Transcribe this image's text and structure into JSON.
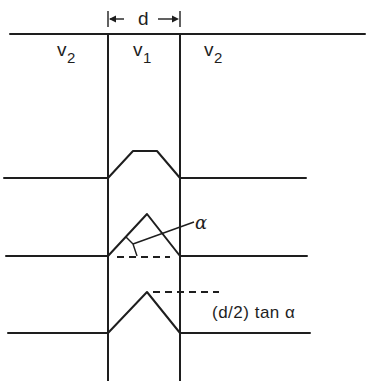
{
  "figure": {
    "type": "schematic",
    "width_label": "d",
    "regions": [
      {
        "label_base": "v",
        "label_sub": "2",
        "position": "left"
      },
      {
        "label_base": "v",
        "label_sub": "1",
        "position": "center"
      },
      {
        "label_base": "v",
        "label_sub": "2",
        "position": "right"
      }
    ],
    "profiles": [
      {
        "shape": "trapezoid",
        "annotation": ""
      },
      {
        "shape": "triangle",
        "annotation": "α"
      },
      {
        "shape": "triangle",
        "annotation": "(d/2) tan α"
      }
    ],
    "angle_label": "α",
    "height_label": "(d/2) tan α"
  },
  "colors": {
    "ink": "#1e1e1e",
    "background": "#ffffff"
  }
}
